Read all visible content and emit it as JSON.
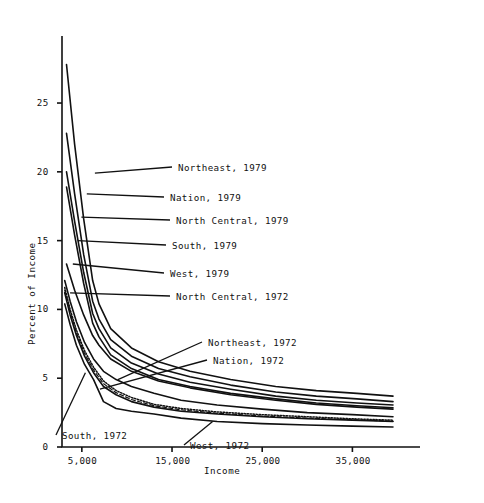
{
  "chart_data": {
    "type": "line",
    "title": "",
    "xlabel": "Income",
    "ylabel": "Percent of Income",
    "xlim": [
      2800,
      40500
    ],
    "ylim": [
      0,
      29
    ],
    "grid": false,
    "legend_position": "inline-annotations",
    "xticks": [
      5000,
      15000,
      25000,
      35000
    ],
    "xticklabels": [
      "5,000",
      "15,000",
      "25,000",
      "35,000"
    ],
    "yticks": [
      0,
      5,
      10,
      15,
      20,
      25
    ],
    "yticklabels": [
      "0",
      "5",
      "10",
      "15",
      "20",
      "25"
    ],
    "series": [
      {
        "name": "Northeast, 1979",
        "style": "solid",
        "label": "Northeast, 1979",
        "x": [
          3300,
          4200,
          5200,
          6200,
          6900,
          8200,
          10500,
          13500,
          17000,
          21500,
          26500,
          31000,
          35500,
          39500
        ],
        "y": [
          27.8,
          22.0,
          16.6,
          12.1,
          10.4,
          8.6,
          7.2,
          6.2,
          5.5,
          4.9,
          4.4,
          4.1,
          3.9,
          3.7
        ]
      },
      {
        "name": "Nation, 1979",
        "style": "solid",
        "label": "Nation, 1979",
        "x": [
          3300,
          4200,
          5200,
          6200,
          6900,
          8200,
          10500,
          13500,
          17000,
          21500,
          26500,
          31000,
          35500,
          39500
        ],
        "y": [
          22.8,
          18.4,
          14.0,
          10.6,
          9.3,
          7.8,
          6.6,
          5.7,
          5.1,
          4.5,
          4.0,
          3.7,
          3.5,
          3.3
        ]
      },
      {
        "name": "North Central, 1979",
        "style": "solid",
        "label": "North Central, 1979",
        "x": [
          3300,
          4200,
          5200,
          6200,
          6900,
          8200,
          10500,
          13500,
          17000,
          21500,
          26500,
          31000,
          35500,
          39500
        ],
        "y": [
          20.0,
          16.4,
          12.7,
          9.7,
          8.6,
          7.2,
          6.1,
          5.3,
          4.7,
          4.2,
          3.7,
          3.4,
          3.2,
          3.05
        ]
      },
      {
        "name": "South, 1979",
        "style": "solid",
        "label": "South, 1979",
        "x": [
          3300,
          4200,
          5200,
          6200,
          6900,
          8200,
          10500,
          13500,
          17000,
          21500,
          26500,
          31000,
          35500,
          39500
        ],
        "y": [
          18.9,
          15.4,
          11.9,
          9.0,
          8.0,
          6.7,
          5.7,
          4.9,
          4.4,
          3.9,
          3.5,
          3.2,
          3.0,
          2.85
        ]
      },
      {
        "name": "West, 1979",
        "style": "solid",
        "label": "West, 1979",
        "x": [
          3300,
          4200,
          5200,
          6200,
          6900,
          8200,
          10500,
          13500,
          17000,
          21500,
          26500,
          31000,
          35500,
          39500
        ],
        "y": [
          13.3,
          11.4,
          9.6,
          8.1,
          7.4,
          6.4,
          5.5,
          4.8,
          4.3,
          3.8,
          3.4,
          3.1,
          2.9,
          2.75
        ]
      },
      {
        "name": "North Central, 1972",
        "style": "solid",
        "label": "North Central, 1972",
        "x": [
          3100,
          3700,
          4400,
          5300,
          6300,
          7400,
          8800,
          10500,
          13000,
          16000,
          20000,
          25000,
          30000,
          35000,
          39500
        ],
        "y": [
          11.2,
          9.6,
          8.1,
          6.6,
          5.4,
          4.4,
          3.8,
          3.3,
          2.9,
          2.6,
          2.4,
          2.2,
          2.05,
          1.95,
          1.85
        ]
      },
      {
        "name": "Northeast, 1972",
        "style": "solid",
        "label": "Northeast, 1972",
        "x": [
          3100,
          3700,
          4400,
          5300,
          6300,
          7400,
          8800,
          10500,
          13000,
          16000,
          20000,
          25000,
          30000,
          35000,
          39500
        ],
        "y": [
          12.1,
          10.6,
          9.1,
          7.6,
          6.4,
          5.5,
          4.9,
          4.4,
          3.9,
          3.4,
          3.05,
          2.75,
          2.5,
          2.35,
          2.2
        ]
      },
      {
        "name": "Nation, 1972",
        "style": "dotted",
        "label": "Nation, 1972",
        "x": [
          3100,
          3700,
          4400,
          5300,
          6300,
          7400,
          8800,
          10500,
          13000,
          16000,
          20000,
          25000,
          30000,
          35000,
          39500
        ],
        "y": [
          11.6,
          10.0,
          8.5,
          7.0,
          5.8,
          4.8,
          4.1,
          3.6,
          3.1,
          2.8,
          2.55,
          2.35,
          2.2,
          2.05,
          1.95
        ]
      },
      {
        "name": "South, 1972",
        "style": "dashed",
        "label": "South, 1972",
        "x": [
          3100,
          3700,
          4400,
          5300,
          6300,
          7400,
          8800,
          10500,
          13000,
          16000,
          20000,
          25000,
          30000,
          35000,
          39500
        ],
        "y": [
          11.4,
          9.8,
          8.3,
          6.8,
          5.6,
          4.6,
          3.95,
          3.45,
          3.0,
          2.7,
          2.45,
          2.25,
          2.1,
          1.98,
          1.88
        ]
      },
      {
        "name": "West, 1972",
        "style": "solid",
        "label": "West, 1972",
        "x": [
          3100,
          3700,
          4400,
          5300,
          6300,
          7400,
          8800,
          10500,
          13000,
          16000,
          20000,
          25000,
          30000,
          35000,
          39500
        ],
        "y": [
          10.4,
          8.9,
          7.4,
          6.0,
          4.9,
          3.3,
          2.8,
          2.6,
          2.4,
          2.1,
          1.85,
          1.7,
          1.6,
          1.52,
          1.45
        ]
      }
    ],
    "annotations": [
      {
        "label": "Northeast, 1979",
        "anchor_x": 6450,
        "anchor_y": 19.9,
        "text_x_px": 178,
        "text_y_px": 162
      },
      {
        "label": "Nation, 1979",
        "anchor_x": 5550,
        "anchor_y": 18.4,
        "text_x_px": 170,
        "text_y_px": 192
      },
      {
        "label": "North Central, 1979",
        "anchor_x": 4950,
        "anchor_y": 16.7,
        "text_x_px": 176,
        "text_y_px": 215
      },
      {
        "label": "South, 1979",
        "anchor_x": 4550,
        "anchor_y": 15.0,
        "text_x_px": 172,
        "text_y_px": 240
      },
      {
        "label": "West, 1979",
        "anchor_x": 4000,
        "anchor_y": 13.3,
        "text_x_px": 170,
        "text_y_px": 268
      },
      {
        "label": "North Central, 1972",
        "anchor_x": 3700,
        "anchor_y": 11.2,
        "text_x_px": 176,
        "text_y_px": 291
      },
      {
        "label": "Northeast, 1972",
        "anchor_x": 9000,
        "anchor_y": 4.9,
        "text_x_px": 208,
        "text_y_px": 337
      },
      {
        "label": "Nation, 1972",
        "anchor_x": 7000,
        "anchor_y": 4.2,
        "text_x_px": 213,
        "text_y_px": 355
      },
      {
        "label": "South, 1972",
        "anchor_x": 5400,
        "anchor_y": 5.4,
        "text_x_px": 62,
        "text_y_px": 430
      },
      {
        "label": "West, 1972",
        "anchor_x": 19500,
        "anchor_y": 1.85,
        "text_x_px": 190,
        "text_y_px": 440
      }
    ]
  }
}
